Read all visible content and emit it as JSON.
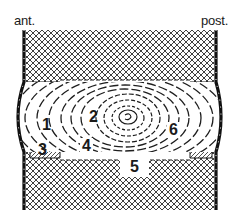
{
  "diagram": {
    "type": "anatomical-cross-section",
    "orientation": {
      "anterior_label": "ant.",
      "posterior_label": "post."
    },
    "regions": [
      {
        "id": "1",
        "label": "1"
      },
      {
        "id": "2",
        "label": "2"
      },
      {
        "id": "3",
        "label": "3"
      },
      {
        "id": "4",
        "label": "4"
      },
      {
        "id": "5",
        "label": "5"
      },
      {
        "id": "6",
        "label": "6"
      }
    ],
    "colors": {
      "ink": "#1a1a1a",
      "background": "#ffffff",
      "hatch": "#333333"
    }
  }
}
